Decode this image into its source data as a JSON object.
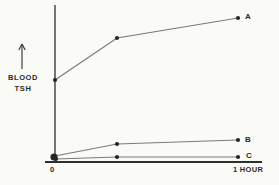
{
  "figure": {
    "background": "#fafaf7",
    "axis_color": "#3c3c3c",
    "curve_color": "#7a7a7a",
    "dot_color": "#262626",
    "text_color": "#2b2b2b"
  },
  "chart_data": {
    "type": "line",
    "title": "",
    "ylabel": "BLOOD TSH",
    "ylabel_lines": [
      "BLOOD",
      "TSH"
    ],
    "ylabel_arrow": "up-arrow indicating increase; no numeric scale shown",
    "xlabel": "",
    "x_tick_labels": [
      "0",
      "1 HOUR"
    ],
    "x_range_hours": [
      0,
      1
    ],
    "x_hours": [
      0,
      0.34,
      1
    ],
    "y_units": "arbitrary (unlabeled axis)",
    "grid": false,
    "legend_position": "labels at right end of each curve",
    "series": [
      {
        "name": "A",
        "values_relative": [
          0.53,
          0.79,
          0.92
        ],
        "points_px": [
          [
            55,
            80
          ],
          [
            117,
            38
          ],
          [
            238,
            18
          ]
        ],
        "label_pos_px": [
          245,
          12
        ]
      },
      {
        "name": "B",
        "values_relative": [
          0.04,
          0.12,
          0.14
        ],
        "points_px": [
          [
            55,
            156
          ],
          [
            117,
            144
          ],
          [
            238,
            140
          ]
        ],
        "label_pos_px": [
          245,
          135
        ]
      },
      {
        "name": "C",
        "values_relative": [
          0.02,
          0.03,
          0.03
        ],
        "points_px": [
          [
            56,
            159
          ],
          [
            117,
            157
          ],
          [
            238,
            157
          ]
        ],
        "label_pos_px": [
          246,
          151
        ]
      }
    ],
    "origin_marker_px": [
      54,
      157
    ],
    "axes_px": {
      "y_axis": [
        [
          55,
          5
        ],
        [
          55,
          162
        ]
      ],
      "x_axis": [
        [
          45,
          162
        ],
        [
          262,
          162
        ]
      ]
    },
    "arrow_px": {
      "x": 22,
      "y_top": 44,
      "y_bottom": 69
    }
  }
}
